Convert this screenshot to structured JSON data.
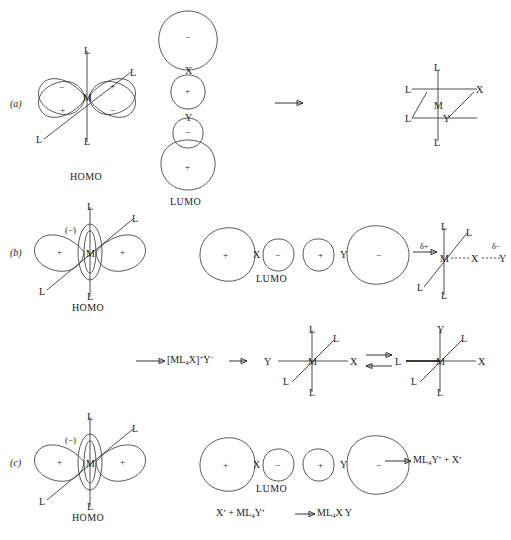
{
  "figure": {
    "sections": [
      {
        "key": "a",
        "label": "(a)"
      },
      {
        "key": "b",
        "label": "(b)"
      },
      {
        "key": "c",
        "label": "(c)"
      }
    ]
  },
  "atoms": {
    "M": "M",
    "L": "L",
    "X": "X",
    "Y": "Y"
  },
  "signs": {
    "plus": "+",
    "minus": "−",
    "minus_paren": "(−)"
  },
  "captions": {
    "homo": "HOMO",
    "lumo": "LUMO"
  },
  "section_a": {
    "label": "(a)",
    "homo": {
      "name": "dx2-y2 metal orbital",
      "center_atom": "M",
      "ligands": [
        "L",
        "L",
        "L",
        "L"
      ],
      "lobes": [
        {
          "position": "upper-left",
          "sign": "−"
        },
        {
          "position": "upper-right",
          "sign": "+"
        },
        {
          "position": "lower-left",
          "sign": "+"
        },
        {
          "position": "lower-right",
          "sign": "−"
        }
      ],
      "caption": "HOMO"
    },
    "lumo": {
      "name": "X-Y sigma-star orbital (vertical)",
      "caption": "LUMO",
      "atoms": [
        "X",
        "Y"
      ],
      "lobes": [
        {
          "order": 1,
          "size": "large",
          "sign": "−"
        },
        {
          "order": 2,
          "size": "small",
          "sign": "+"
        },
        {
          "order": 3,
          "size": "small",
          "sign": "−"
        },
        {
          "order": 4,
          "size": "large",
          "sign": "+"
        }
      ]
    },
    "arrow": "→",
    "product": {
      "center_atom": "M",
      "ligands": [
        "L",
        "L",
        "L",
        "L"
      ],
      "added": [
        "X",
        "Y"
      ],
      "description": "cis oxidative addition product"
    }
  },
  "section_b": {
    "label": "(b)",
    "homo": {
      "name": "dz2 metal orbital with torus",
      "center_atom": "M",
      "ligands": [
        "L",
        "L",
        "L",
        "L"
      ],
      "torus_sign": "(−)",
      "lobes": [
        {
          "position": "left",
          "sign": "+"
        },
        {
          "position": "right",
          "sign": "+"
        }
      ],
      "caption": "HOMO"
    },
    "lumo": {
      "name": "X-Y sigma-star orbital (horizontal)",
      "caption": "LUMO",
      "atoms": [
        "X",
        "Y"
      ],
      "lobes": [
        {
          "order": 1,
          "size": "large",
          "sign": "+"
        },
        {
          "order": 2,
          "size": "small",
          "sign": "−"
        },
        {
          "order": 3,
          "size": "small",
          "sign": "+"
        },
        {
          "order": 4,
          "size": "large",
          "sign": "−"
        }
      ]
    },
    "arrow": "→",
    "transition_state": {
      "center_atom": "M",
      "ligands": [
        "L",
        "L",
        "L",
        "L"
      ],
      "charge_metal": "δ+",
      "charge_y": "δ−",
      "chain": [
        "M",
        "X",
        "Y"
      ],
      "bond_style": "dashed"
    },
    "step2": {
      "arrow_left": "→",
      "intermediate_prefix": "[ML",
      "intermediate_sub": "4",
      "intermediate_mid": "X]",
      "intermediate_sup1": "+",
      "intermediate_y": "Y",
      "intermediate_sup2": "−",
      "intermediate_full": "[ML4X]+Y−",
      "arrow_right": "→"
    },
    "octahedral_left": {
      "center_atom": "M",
      "ligands": [
        "L",
        "L",
        "L",
        "L"
      ],
      "axial_left": "Y",
      "axial_right": "X"
    },
    "equilibrium": {
      "forward": "→",
      "reverse": "←"
    },
    "octahedral_right": {
      "center_atom": "M",
      "ligands": [
        "L",
        "L",
        "L",
        "L"
      ],
      "top": "Y",
      "axial_right": "X"
    }
  },
  "section_c": {
    "label": "(c)",
    "homo": {
      "name": "dz2 metal orbital with torus",
      "center_atom": "M",
      "ligands": [
        "L",
        "L",
        "L",
        "L"
      ],
      "torus_sign": "(−)",
      "lobes": [
        {
          "position": "left",
          "sign": "+"
        },
        {
          "position": "right",
          "sign": "+"
        }
      ],
      "caption": "HOMO"
    },
    "lumo": {
      "name": "X-Y sigma-star orbital (horizontal)",
      "caption": "LUMO",
      "atoms": [
        "X",
        "Y"
      ],
      "lobes": [
        {
          "order": 1,
          "size": "large",
          "sign": "+"
        },
        {
          "order": 2,
          "size": "small",
          "sign": "−"
        },
        {
          "order": 3,
          "size": "small",
          "sign": "+"
        },
        {
          "order": 4,
          "size": "large",
          "sign": "−"
        }
      ]
    },
    "product_arrow": "→",
    "product_text": {
      "prefix": "ML",
      "sub": "4",
      "rest": "Y",
      "radical1": "•",
      "plus": " + ",
      "tail": "X",
      "radical2": "•",
      "full": "ML4Y• + X•"
    },
    "bottom_equation": {
      "left_x": "X",
      "left_radical": "•",
      "plus": " + ",
      "ml4y": "ML",
      "ml4y_sub": "4",
      "ml4y_rest": "Y",
      "ml4y_radical": "•",
      "arrow": "→",
      "product": "ML",
      "product_sub": "4",
      "product_rest": "X Y",
      "full": "X• + ML4Y• → ML4X Y"
    }
  },
  "colors": {
    "stroke": "#3a3a3a",
    "text": "#1a1a1a",
    "background": "#ffffff"
  }
}
